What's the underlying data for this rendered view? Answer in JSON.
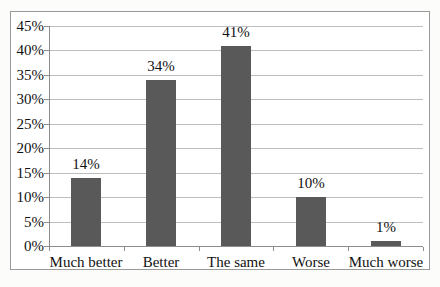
{
  "chart_data": {
    "type": "bar",
    "title": "",
    "xlabel": "",
    "ylabel": "",
    "categories": [
      "Much better",
      "Better",
      "The same",
      "Worse",
      "Much worse"
    ],
    "values": [
      14,
      34,
      41,
      10,
      1
    ],
    "data_labels": [
      "14%",
      "34%",
      "41%",
      "10%",
      "1%"
    ],
    "ylim": [
      0,
      45
    ],
    "ytick_step": 5,
    "ytick_labels": [
      "45%",
      "40%",
      "35%",
      "30%",
      "25%",
      "20%",
      "15%",
      "10%",
      "5%",
      "0%"
    ],
    "grid": true,
    "legend": "none",
    "colors": {
      "bar": "#595959",
      "gridline": "#bdbdbd",
      "axis": "#8c8c8c",
      "frame_border": "#999999",
      "text": "#111111",
      "plot_background": "#ffffff"
    }
  }
}
